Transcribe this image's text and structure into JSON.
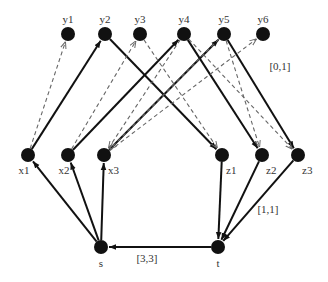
{
  "diagram": {
    "type": "flow-network",
    "colors": {
      "node": "#111111",
      "solid_edge": "#111111",
      "dashed_edge": "#666666",
      "label": "#333333",
      "background": "#ffffff"
    },
    "nodes": [
      {
        "id": "y1",
        "label": "y1",
        "x": 68,
        "y": 34,
        "label_pos": "top"
      },
      {
        "id": "y2",
        "label": "y2",
        "x": 105,
        "y": 34,
        "label_pos": "top"
      },
      {
        "id": "y3",
        "label": "y3",
        "x": 140,
        "y": 34,
        "label_pos": "top"
      },
      {
        "id": "y4",
        "label": "y4",
        "x": 184,
        "y": 34,
        "label_pos": "top"
      },
      {
        "id": "y5",
        "label": "y5",
        "x": 224,
        "y": 34,
        "label_pos": "top"
      },
      {
        "id": "y6",
        "label": "y6",
        "x": 263,
        "y": 34,
        "label_pos": "top"
      },
      {
        "id": "x1",
        "label": "x1",
        "x": 28,
        "y": 155,
        "label_pos": "bottom"
      },
      {
        "id": "x2",
        "label": "x2",
        "x": 68,
        "y": 155,
        "label_pos": "bottom"
      },
      {
        "id": "x3",
        "label": "x3",
        "x": 104,
        "y": 155,
        "label_pos": "bottom-right"
      },
      {
        "id": "z1",
        "label": "z1",
        "x": 222,
        "y": 155,
        "label_pos": "bottom-right"
      },
      {
        "id": "z2",
        "label": "z2",
        "x": 262,
        "y": 155,
        "label_pos": "bottom-right"
      },
      {
        "id": "z3",
        "label": "z3",
        "x": 298,
        "y": 155,
        "label_pos": "bottom-right"
      },
      {
        "id": "s",
        "label": "s",
        "x": 101,
        "y": 247,
        "label_pos": "bottom"
      },
      {
        "id": "t",
        "label": "t",
        "x": 218,
        "y": 247,
        "label_pos": "bottom"
      }
    ],
    "edges": [
      {
        "from": "s",
        "to": "x1",
        "style": "solid"
      },
      {
        "from": "s",
        "to": "x2",
        "style": "solid"
      },
      {
        "from": "s",
        "to": "x3",
        "style": "solid"
      },
      {
        "from": "t",
        "to": "s",
        "style": "solid"
      },
      {
        "from": "z1",
        "to": "t",
        "style": "solid"
      },
      {
        "from": "z2",
        "to": "t",
        "style": "solid"
      },
      {
        "from": "z3",
        "to": "t",
        "style": "solid"
      },
      {
        "from": "x1",
        "to": "y2",
        "style": "solid"
      },
      {
        "from": "x2",
        "to": "y4",
        "style": "solid"
      },
      {
        "from": "x3",
        "to": "y5",
        "style": "solid"
      },
      {
        "from": "y2",
        "to": "z1",
        "style": "solid"
      },
      {
        "from": "y4",
        "to": "z2",
        "style": "solid"
      },
      {
        "from": "y5",
        "to": "z3",
        "style": "solid"
      },
      {
        "from": "x1",
        "to": "y1",
        "style": "dashed"
      },
      {
        "from": "x2",
        "to": "y3",
        "style": "dashed"
      },
      {
        "from": "x3",
        "to": "y6",
        "style": "dashed"
      },
      {
        "from": "y4",
        "to": "x3",
        "style": "dashed"
      },
      {
        "from": "y5",
        "to": "x3",
        "style": "dashed"
      },
      {
        "from": "y3",
        "to": "z1",
        "style": "dashed"
      },
      {
        "from": "y4",
        "to": "z3",
        "style": "dashed"
      },
      {
        "from": "y5",
        "to": "z2",
        "style": "dashed"
      }
    ],
    "edge_labels": [
      {
        "text": "[0,1]",
        "x": 280,
        "y": 70
      },
      {
        "text": "[1,1]",
        "x": 268,
        "y": 213
      },
      {
        "text": "[3,3]",
        "x": 147,
        "y": 262
      }
    ]
  }
}
